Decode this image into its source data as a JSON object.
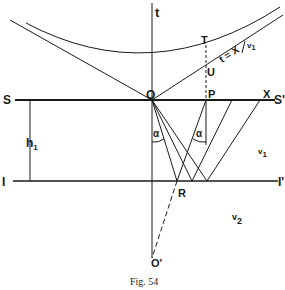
{
  "figure": {
    "caption": "Fig. 54",
    "labels": {
      "t_axis": "t",
      "T": "T",
      "U": "U",
      "O": "O",
      "P": "P",
      "X": "X",
      "S": "S",
      "S_prime": "S'",
      "I": "I",
      "I_prime": "I'",
      "h1_main": "h",
      "h1_sub": "1",
      "alpha_left": "α",
      "alpha_right": "α",
      "R": "R",
      "O_prime": "O'",
      "v1_main": "v",
      "v1_sub": "1",
      "v2_main": "v",
      "v2_sub": "2",
      "line_eq_main": "t = X",
      "line_eq_den": "v",
      "line_eq_den_sub": "1"
    }
  },
  "colors": {
    "ink": "#1a1a1a",
    "paper": "#ffffff"
  }
}
